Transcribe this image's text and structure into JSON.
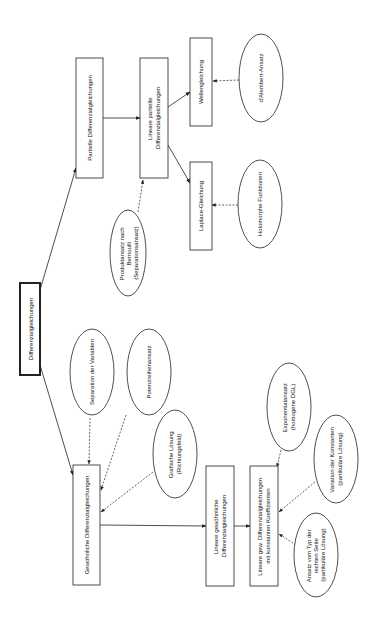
{
  "diagram": {
    "title": "Differenzialgleichungen",
    "orientation": "rotated 90deg clockwise (text reads bottom-to-top)",
    "nodes": {
      "root": {
        "label": "Differenzialgleichungen",
        "shape": "box-bold"
      },
      "partielle": {
        "label": "Partielle Differenzialgleichungen",
        "shape": "box"
      },
      "lin_partielle": {
        "lines": [
          "Lineare partielle",
          "Differenzialgleichungen"
        ],
        "shape": "box"
      },
      "welle": {
        "label": "Wellengleichung",
        "shape": "box"
      },
      "dalembert": {
        "label": "d'Alembert-Ansatz",
        "shape": "ellipse"
      },
      "laplace": {
        "label": "Laplace-Gleichung",
        "shape": "box"
      },
      "holomorph": {
        "label": "Holomorphe Funktionen",
        "shape": "ellipse"
      },
      "produkt": {
        "lines": [
          "Produktansatz nach",
          "Bernoulli",
          "(Separationsansatz)"
        ],
        "shape": "ellipse"
      },
      "separation": {
        "label": "Separation der Variablen",
        "shape": "ellipse"
      },
      "potenz": {
        "label": "Potenzreihenansatz",
        "shape": "ellipse"
      },
      "grafisch": {
        "lines": [
          "Grafische Lösung",
          "(Richtungsfeld)"
        ],
        "shape": "ellipse"
      },
      "gewoehnlich": {
        "label": "Gewöhnliche Differenzialgleichungen",
        "shape": "box"
      },
      "lin_gew": {
        "lines": [
          "Lineare gewöhnliche",
          "Differenzialgleichungen"
        ],
        "shape": "box"
      },
      "lin_konst": {
        "lines": [
          "Lineare gew. Differenzialgleichungen",
          "mit konstanten Koeffizienten"
        ],
        "shape": "box"
      },
      "exponential": {
        "lines": [
          "Exponentialansatz",
          "(homogene DGL)"
        ],
        "shape": "ellipse"
      },
      "variation": {
        "lines": [
          "Variation der Konstanten",
          "(partikuläre Lösung)"
        ],
        "shape": "ellipse"
      },
      "ansatz_rs": {
        "lines": [
          "Ansatz vom Typ der",
          "rechten Seite",
          "(partikuläre Lösung)"
        ],
        "shape": "ellipse"
      }
    },
    "edges": [
      {
        "from": "root",
        "to": "partielle",
        "style": "solid"
      },
      {
        "from": "root",
        "to": "gewoehnlich",
        "style": "solid"
      },
      {
        "from": "partielle",
        "to": "lin_partielle",
        "style": "solid"
      },
      {
        "from": "lin_partielle",
        "to": "welle",
        "style": "solid"
      },
      {
        "from": "lin_partielle",
        "to": "laplace",
        "style": "solid"
      },
      {
        "from": "dalembert",
        "to": "welle",
        "style": "dashed"
      },
      {
        "from": "holomorph",
        "to": "laplace",
        "style": "dashed"
      },
      {
        "from": "produkt",
        "to": "lin_partielle",
        "style": "dashed"
      },
      {
        "from": "separation",
        "to": "gewoehnlich",
        "style": "dashed"
      },
      {
        "from": "potenz",
        "to": "gewoehnlich",
        "style": "dashed"
      },
      {
        "from": "grafisch",
        "to": "gewoehnlich",
        "style": "dashed"
      },
      {
        "from": "gewoehnlich",
        "to": "lin_gew",
        "style": "solid"
      },
      {
        "from": "lin_gew",
        "to": "lin_konst",
        "style": "solid"
      },
      {
        "from": "exponential",
        "to": "lin_konst",
        "style": "dashed"
      },
      {
        "from": "variation",
        "to": "lin_konst",
        "style": "dashed"
      },
      {
        "from": "ansatz_rs",
        "to": "lin_konst",
        "style": "dashed"
      }
    ],
    "colors": {
      "stroke": "#222222",
      "text": "#111111",
      "background": "#ffffff"
    }
  }
}
